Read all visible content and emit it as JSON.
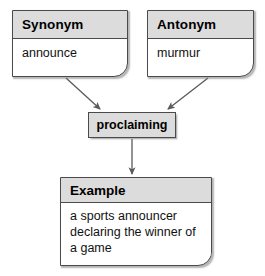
{
  "diagram": {
    "type": "concept-map",
    "title": "",
    "nodes": {
      "synonym": {
        "header": "Synonym",
        "body": "announce"
      },
      "antonym": {
        "header": "Antonym",
        "body": "murmur"
      },
      "term": {
        "label": "proclaiming"
      },
      "example": {
        "header": "Example",
        "body_lines": [
          "a sports announcer",
          "declaring the winner of",
          "a game"
        ]
      }
    },
    "edges": [
      {
        "from": "synonym",
        "to": "term",
        "style": "arrow"
      },
      {
        "from": "antonym",
        "to": "term",
        "style": "arrow"
      },
      {
        "from": "term",
        "to": "example",
        "style": "arrow"
      }
    ],
    "colors": {
      "header_fill": "#dcdcdc",
      "body_fill": "#ffffff",
      "border": "#4a4a4a",
      "text": "#111111",
      "arrow": "#5a5a5a",
      "background": "#ffffff"
    }
  }
}
